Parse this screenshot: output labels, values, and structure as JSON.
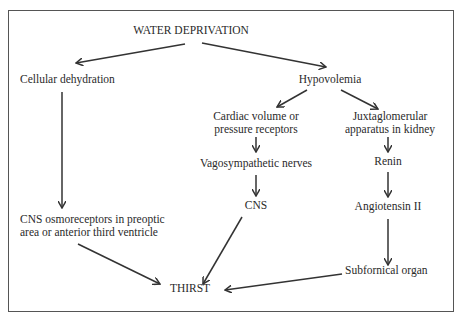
{
  "diagram": {
    "title": "WATER DEPRIVATION",
    "nodes": {
      "water_deprivation": "WATER DEPRIVATION",
      "cellular_dehydration": "Cellular dehydration",
      "hypovolemia": "Hypovolemia",
      "cardiac_receptors_line1": "Cardiac volume or",
      "cardiac_receptors_line2": "pressure receptors",
      "juxtaglomerular_line1": "Juxtaglomerular",
      "juxtaglomerular_line2": "apparatus in kidney",
      "vagosympathetic": "Vagosympathetic nerves",
      "renin": "Renin",
      "cns": "CNS",
      "angiotensin": "Angiotensin II",
      "cns_osmoreceptors_line1": "CNS osmoreceptors in preoptic",
      "cns_osmoreceptors_line2": "area or anterior third ventricle",
      "subfornical": "Subfornical organ",
      "thirst": "THIRST"
    },
    "edges": [
      {
        "from": "water_deprivation",
        "to": "cellular_dehydration"
      },
      {
        "from": "water_deprivation",
        "to": "hypovolemia"
      },
      {
        "from": "cellular_dehydration",
        "to": "cns_osmoreceptors"
      },
      {
        "from": "hypovolemia",
        "to": "cardiac_receptors"
      },
      {
        "from": "hypovolemia",
        "to": "juxtaglomerular"
      },
      {
        "from": "cardiac_receptors",
        "to": "vagosympathetic"
      },
      {
        "from": "vagosympathetic",
        "to": "cns"
      },
      {
        "from": "juxtaglomerular",
        "to": "renin"
      },
      {
        "from": "renin",
        "to": "angiotensin"
      },
      {
        "from": "angiotensin",
        "to": "subfornical"
      },
      {
        "from": "cns_osmoreceptors",
        "to": "thirst"
      },
      {
        "from": "cns",
        "to": "thirst"
      },
      {
        "from": "subfornical",
        "to": "thirst"
      }
    ]
  }
}
